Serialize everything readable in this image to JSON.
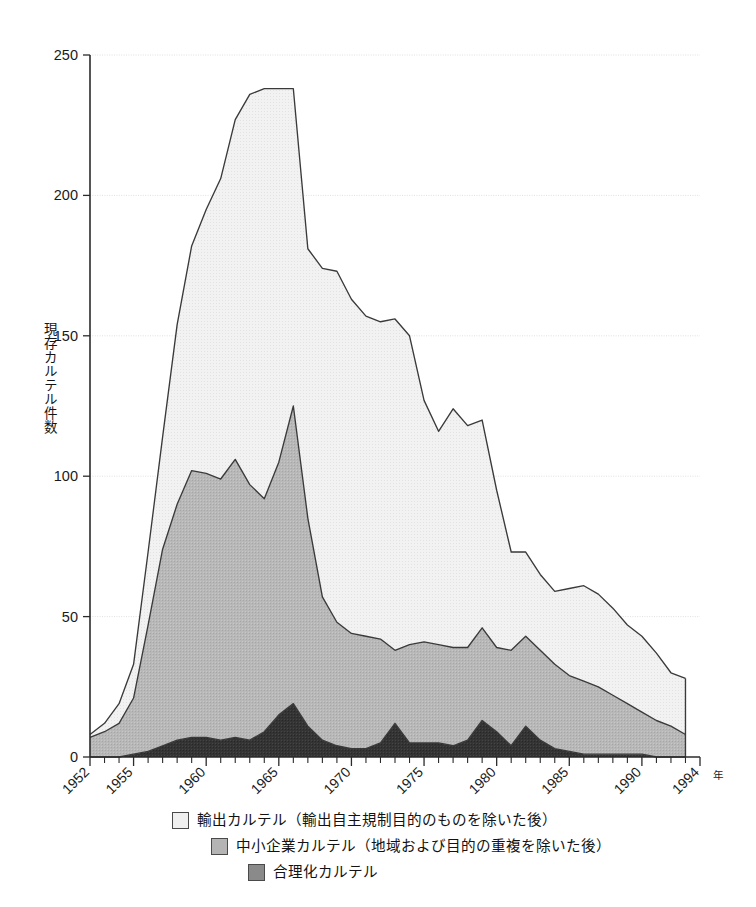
{
  "chart_data": {
    "type": "area",
    "stacked": true,
    "title": "",
    "xlabel": "年",
    "ylabel": "現存カルテル件数",
    "ylim": [
      0,
      250
    ],
    "yticks": [
      0,
      50,
      100,
      150,
      200,
      250
    ],
    "ytick_labels": [
      "0",
      "50",
      "100",
      "150",
      "200",
      "250"
    ],
    "xlim": [
      1952,
      1994
    ],
    "xticks_major": [
      1952,
      1955,
      1960,
      1965,
      1970,
      1975,
      1980,
      1985,
      1990,
      1994
    ],
    "xtick_labels": [
      "1952",
      "1955",
      "1960",
      "1965",
      "1970",
      "1975",
      "1980",
      "1985",
      "1990",
      "1994"
    ],
    "grid": true,
    "grid_axis": "y",
    "legend_position": "below",
    "x": [
      1952,
      1953,
      1954,
      1955,
      1956,
      1957,
      1958,
      1959,
      1960,
      1961,
      1962,
      1963,
      1964,
      1965,
      1966,
      1967,
      1968,
      1969,
      1970,
      1971,
      1972,
      1973,
      1974,
      1975,
      1976,
      1977,
      1978,
      1979,
      1980,
      1981,
      1982,
      1983,
      1984,
      1985,
      1986,
      1987,
      1988,
      1989,
      1990,
      1991,
      1992,
      1993
    ],
    "series": [
      {
        "name": "合理化カルテル",
        "color": "#333333",
        "values": [
          0,
          0,
          0,
          1,
          2,
          4,
          6,
          7,
          7,
          6,
          7,
          6,
          9,
          15,
          19,
          11,
          6,
          4,
          3,
          3,
          5,
          12,
          5,
          5,
          5,
          4,
          6,
          13,
          9,
          4,
          11,
          6,
          3,
          2,
          1,
          1,
          1,
          1,
          1,
          0,
          0,
          0
        ]
      },
      {
        "name": "中小企業カルテル（地域および目的の重複を除いた後）",
        "color": "#b4b4b4",
        "values": [
          7,
          9,
          12,
          20,
          45,
          70,
          84,
          95,
          94,
          93,
          99,
          91,
          83,
          90,
          106,
          74,
          51,
          44,
          41,
          40,
          37,
          26,
          35,
          36,
          35,
          35,
          33,
          33,
          30,
          34,
          32,
          32,
          30,
          27,
          26,
          24,
          21,
          18,
          15,
          13,
          11,
          8
        ]
      },
      {
        "name": "輸出カルテル（輸出自主規制目的のものを除いた後）",
        "color": "#f0f0f0",
        "values": [
          1,
          3,
          7,
          12,
          26,
          40,
          64,
          80,
          94,
          107,
          121,
          139,
          146,
          133,
          113,
          96,
          117,
          125,
          119,
          114,
          113,
          118,
          110,
          86,
          76,
          85,
          79,
          74,
          56,
          35,
          30,
          27,
          26,
          31,
          34,
          33,
          31,
          28,
          27,
          24,
          19,
          20
        ]
      }
    ],
    "totals": [
      8,
      12,
      19,
      33,
      73,
      114,
      154,
      182,
      195,
      206,
      227,
      236,
      238,
      238,
      238,
      181,
      174,
      173,
      163,
      157,
      155,
      156,
      150,
      127,
      116,
      124,
      118,
      120,
      95,
      73,
      73,
      65,
      59,
      60,
      61,
      58,
      53,
      47,
      43,
      37,
      30,
      28
    ]
  },
  "legend": {
    "items": [
      {
        "label": "輸出カルテル（輸出自主規制目的のものを除いた後）",
        "swatch": "#f0f0f0"
      },
      {
        "label": "中小企業カルテル（地域および目的の重複を除いた後）",
        "swatch": "#b4b4b4"
      },
      {
        "label": "合理化カルテル",
        "swatch": "#8a8a8a"
      }
    ]
  },
  "axes": {
    "y_title": "現存カルテル件数",
    "x_unit": "年"
  }
}
